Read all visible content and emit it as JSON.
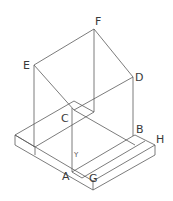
{
  "diagram": {
    "type": "isometric-solid",
    "labels": {
      "F": "F",
      "E": "E",
      "D": "D",
      "C": "C",
      "B": "B",
      "H": "H",
      "A": "A",
      "G": "G",
      "Y": "Y"
    }
  }
}
